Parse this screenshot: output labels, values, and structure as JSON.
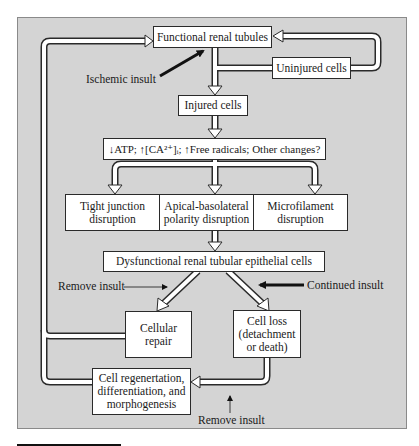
{
  "diagram": {
    "colors": {
      "panel": "#d4d4d4",
      "box": "#ffffff",
      "stroke": "#2a2a2a",
      "arrow_fill": "#ffffff",
      "insult_arrow": "#111111"
    },
    "nodes": {
      "functional": "Functional renal tubules",
      "uninjured": "Uninjured cells",
      "injured": "Injured cells",
      "changes": "↓ATP; ↑[CA²⁺]ᵢ; ↑Free radicals; Other changes?",
      "tight_junction": "Tight junction\ndisruption",
      "polarity": "Apical-basolateral\npolarity disruption",
      "microfilament": "Microfilament\ndisruption",
      "dysfunctional": "Dysfunctional renal tubular epithelial cells",
      "repair": "Cellular\nrepair",
      "cell_loss": "Cell loss\n(detachment\nor death)",
      "regeneration": "Cell regenertation,\ndifferentiation, and\nmorphogenesis"
    },
    "labels": {
      "ischemic_insult": "Ischemic insult",
      "remove_insult_top": "Remove insult",
      "continued_insult": "Continued insult",
      "remove_insult_bottom": "Remove insult"
    },
    "edges": [
      {
        "from": "functional",
        "to": "injured"
      },
      {
        "from": "functional",
        "to": "uninjured"
      },
      {
        "from": "uninjured",
        "to": "functional"
      },
      {
        "from": "injured",
        "to": "changes"
      },
      {
        "from": "changes",
        "to": "tight_junction"
      },
      {
        "from": "changes",
        "to": "polarity"
      },
      {
        "from": "changes",
        "to": "microfilament"
      },
      {
        "from": "polarity",
        "to": "dysfunctional"
      },
      {
        "from": "dysfunctional",
        "to": "repair",
        "label": "Remove insult"
      },
      {
        "from": "dysfunctional",
        "to": "cell_loss",
        "label": "Continued insult"
      },
      {
        "from": "repair",
        "to": "functional"
      },
      {
        "from": "cell_loss",
        "to": "regeneration",
        "label": "Remove insult"
      },
      {
        "from": "regeneration",
        "to": "functional"
      }
    ]
  }
}
